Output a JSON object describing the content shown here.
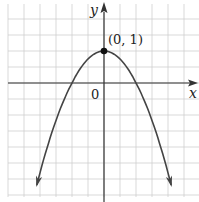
{
  "chart_data": {
    "type": "line",
    "title": "",
    "function": "y = 1 - x^2",
    "xlabel": "x",
    "ylabel": "y",
    "origin_label": "0",
    "xlim": [
      -3.0,
      3.0
    ],
    "ylim": [
      -3.5,
      2.5
    ],
    "grid": true,
    "grid_step": 0.5,
    "series": [
      {
        "name": "parabola",
        "x": [
          -2.1,
          -1.5,
          -1.0,
          -0.5,
          0,
          0.5,
          1.0,
          1.5,
          2.1
        ],
        "y": [
          -3.41,
          -1.25,
          0,
          0.75,
          1,
          0.75,
          0,
          -1.25,
          -3.41
        ],
        "arrows_both_ends": true
      }
    ],
    "annotations": [
      {
        "x": 0,
        "y": 1,
        "text": "(0, 1)",
        "marker": "filled-dot"
      }
    ],
    "colors": {
      "grid": "#cfcfcf",
      "axis": "#333333",
      "curve": "#444444"
    }
  }
}
